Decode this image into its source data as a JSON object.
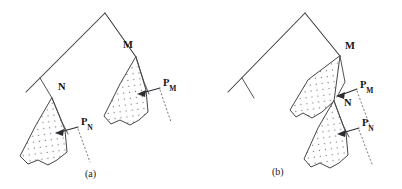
{
  "figure": {
    "background_color": "#ffffff",
    "line_color": "#3a3a3e",
    "stipple_color": "#6e6e74",
    "dotted_leader_color": "#7c7c82",
    "arrow_color": "#2e2e32",
    "width": 402,
    "height": 189
  },
  "panels": [
    {
      "id": "panel-a",
      "caption": "(a)",
      "caption_x": 85,
      "caption_y": 169,
      "description": "Ridge apex with two separate stippled wedges hanging from nodes N and M",
      "nodes": [
        {
          "name": "M",
          "label": "M",
          "label_x": 123,
          "label_y": 40,
          "point_x": 136,
          "point_y": 57
        },
        {
          "name": "N",
          "label": "N",
          "label_x": 58,
          "label_y": 82,
          "point_x": 52,
          "point_y": 98
        }
      ],
      "arrows": [
        {
          "name": "P_M",
          "label": "P",
          "subscript": "M",
          "label_x": 163,
          "label_y": 78,
          "tip_x": 138,
          "tip_y": 93,
          "tail_x": 161,
          "tail_y": 88
        },
        {
          "name": "P_N",
          "label": "P",
          "subscript": "N",
          "label_x": 81,
          "label_y": 117,
          "tip_x": 56,
          "tip_y": 133,
          "tail_x": 79,
          "tail_y": 127
        }
      ]
    },
    {
      "id": "panel-b",
      "caption": "(b)",
      "caption_x": 272,
      "caption_y": 167,
      "description": "Ridge apex with two stacked stippled wedges; N lies on the lower tip of the M wedge",
      "nodes": [
        {
          "name": "M",
          "label": "M",
          "label_x": 345,
          "label_y": 41,
          "point_x": 340,
          "point_y": 56
        },
        {
          "name": "N",
          "label": "N",
          "label_x": 344,
          "label_y": 98,
          "point_x": 334,
          "point_y": 101
        }
      ],
      "arrows": [
        {
          "name": "P_M",
          "label": "P",
          "subscript": "M",
          "label_x": 360,
          "label_y": 80,
          "tip_x": 337,
          "tip_y": 95,
          "tail_x": 358,
          "tail_y": 89
        },
        {
          "name": "P_N",
          "label": "P",
          "subscript": "N",
          "label_x": 362,
          "label_y": 118,
          "tip_x": 338,
          "tip_y": 134,
          "tail_x": 360,
          "tail_y": 128
        }
      ]
    }
  ]
}
